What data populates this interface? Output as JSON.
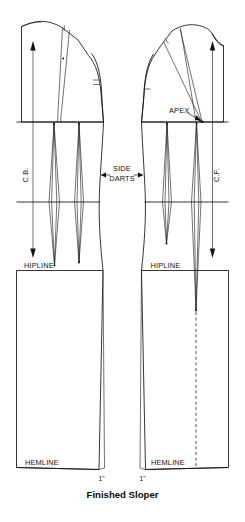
{
  "figure": {
    "caption": "Finished Sloper",
    "title_alt": "Finished Sloper"
  },
  "labels": {
    "center_back": "C.B.",
    "center_front": "C.F.",
    "apex": "APEX",
    "side_darts_line1": "SIDE",
    "side_darts_line2": "DARTS",
    "hipline_back": "HIPLINE",
    "hipline_front": "HIPLINE",
    "hemline_back": "HEMLINE",
    "hemline_front": "HEMLINE",
    "hem_ease_back": "1\"",
    "hem_ease_front": "1\""
  },
  "panels": [
    {
      "name": "back-sloper",
      "side": "back",
      "grainline_label": "C.B.",
      "hipline_label": "HIPLINE",
      "hemline_label": "HEMLINE",
      "hem_measure": "1\"",
      "darts": [
        "back-waist-dart-inner",
        "back-waist-dart-outer"
      ],
      "has_shoulder_dart": true,
      "has_dashed_center": false
    },
    {
      "name": "front-sloper",
      "side": "front",
      "grainline_label": "C.F.",
      "hipline_label": "HIPLINE",
      "hemline_label": "HEMLINE",
      "hem_measure": "1\"",
      "apex_label": "APEX",
      "darts": [
        "front-waist-dart-inner",
        "front-waist-dart-outer"
      ],
      "has_shoulder_dart": true,
      "has_dashed_center": true
    }
  ],
  "colors": {
    "ink": "#121212",
    "paper": "#ffffff",
    "thin_ink": "#1a1a1a"
  }
}
